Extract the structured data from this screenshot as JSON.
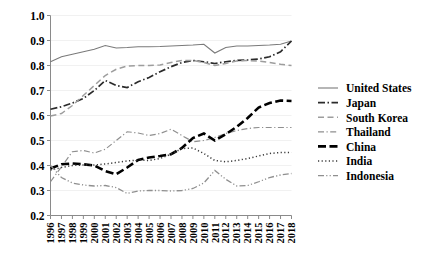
{
  "chart_data": {
    "type": "line",
    "title": "",
    "subtitle": "",
    "xlabel": "",
    "ylabel": "",
    "xlim": [
      1996,
      2018
    ],
    "ylim": [
      0.2,
      1.0
    ],
    "yticks": [
      "1.0",
      "0.9",
      "0.8",
      "0.7",
      "0.6",
      "0.5",
      "0.4",
      "0.3",
      "0.2"
    ],
    "ytick_values": [
      1.0,
      0.9,
      0.8,
      0.7,
      0.6,
      0.5,
      0.4,
      0.3,
      0.2
    ],
    "grid": true,
    "legend_position": "right",
    "x": [
      1996,
      1997,
      1998,
      1999,
      2000,
      2001,
      2002,
      2003,
      2004,
      2005,
      2006,
      2007,
      2008,
      2009,
      2010,
      2011,
      2012,
      2013,
      2014,
      2015,
      2016,
      2017,
      2018
    ],
    "xticks": [
      "1996",
      "1997",
      "1998",
      "1999",
      "2000",
      "2001",
      "2002",
      "2003",
      "2004",
      "2005",
      "2006",
      "2007",
      "2008",
      "2009",
      "2010",
      "2011",
      "2012",
      "2013",
      "2014",
      "2015",
      "2016",
      "2017",
      "2018"
    ],
    "series": [
      {
        "name": "United States",
        "style": "solid",
        "color": "#7a7a7a",
        "width": 1.1,
        "dash": "",
        "values": [
          0.815,
          0.835,
          0.845,
          0.855,
          0.865,
          0.88,
          0.87,
          0.872,
          0.875,
          0.875,
          0.876,
          0.878,
          0.88,
          0.882,
          0.885,
          0.85,
          0.872,
          0.878,
          0.878,
          0.88,
          0.882,
          0.885,
          0.898
        ]
      },
      {
        "name": "Japan",
        "style": "dash-dot",
        "color": "#2b2b2b",
        "width": 1.7,
        "dash": "7,2.5,1.5,2.5",
        "values": [
          0.625,
          0.635,
          0.65,
          0.668,
          0.7,
          0.74,
          0.72,
          0.712,
          0.735,
          0.752,
          0.775,
          0.795,
          0.812,
          0.82,
          0.815,
          0.808,
          0.815,
          0.82,
          0.822,
          0.826,
          0.835,
          0.855,
          0.898
        ]
      },
      {
        "name": "South Korea",
        "style": "dashed",
        "color": "#9d9d9d",
        "width": 1.5,
        "dash": "6,3.5",
        "values": [
          0.598,
          0.608,
          0.64,
          0.68,
          0.72,
          0.76,
          0.785,
          0.798,
          0.8,
          0.8,
          0.802,
          0.812,
          0.82,
          0.82,
          0.812,
          0.8,
          0.808,
          0.818,
          0.82,
          0.818,
          0.812,
          0.805,
          0.8
        ]
      },
      {
        "name": "Thailand",
        "style": "dash-dot-thin",
        "color": "#8f8f8f",
        "width": 1.2,
        "dash": "6,2.5,1.2,2.5",
        "values": [
          0.335,
          0.395,
          0.455,
          0.46,
          0.45,
          0.465,
          0.5,
          0.535,
          0.53,
          0.52,
          0.528,
          0.545,
          0.52,
          0.495,
          0.5,
          0.512,
          0.528,
          0.54,
          0.548,
          0.552,
          0.552,
          0.552,
          0.552
        ]
      },
      {
        "name": "China",
        "style": "bold-dashed",
        "color": "#000000",
        "width": 2.6,
        "dash": "8,3.5",
        "values": [
          0.388,
          0.405,
          0.408,
          0.405,
          0.4,
          0.378,
          0.365,
          0.392,
          0.422,
          0.432,
          0.438,
          0.445,
          0.47,
          0.51,
          0.528,
          0.5,
          0.525,
          0.555,
          0.59,
          0.632,
          0.65,
          0.66,
          0.658
        ]
      },
      {
        "name": "India",
        "style": "dotted",
        "color": "#3a3a3a",
        "width": 1.5,
        "dash": "1.2,2.4",
        "values": [
          0.382,
          0.392,
          0.4,
          0.402,
          0.402,
          0.406,
          0.412,
          0.418,
          0.422,
          0.42,
          0.428,
          0.445,
          0.468,
          0.47,
          0.448,
          0.42,
          0.415,
          0.42,
          0.428,
          0.438,
          0.448,
          0.452,
          0.452
        ]
      },
      {
        "name": "Indonesia",
        "style": "dash-dot-dot",
        "color": "#8f8f8f",
        "width": 1.3,
        "dash": "6,2.2,1.2,2.2,1.2,2.2",
        "values": [
          0.4,
          0.352,
          0.33,
          0.322,
          0.318,
          0.32,
          0.312,
          0.288,
          0.298,
          0.3,
          0.3,
          0.298,
          0.3,
          0.308,
          0.33,
          0.38,
          0.345,
          0.318,
          0.32,
          0.335,
          0.352,
          0.362,
          0.368
        ]
      }
    ]
  },
  "legend": {
    "items": [
      {
        "label": "United States"
      },
      {
        "label": "Japan"
      },
      {
        "label": "South Korea"
      },
      {
        "label": "Thailand"
      },
      {
        "label": "China"
      },
      {
        "label": "India"
      },
      {
        "label": "Indonesia"
      }
    ]
  }
}
